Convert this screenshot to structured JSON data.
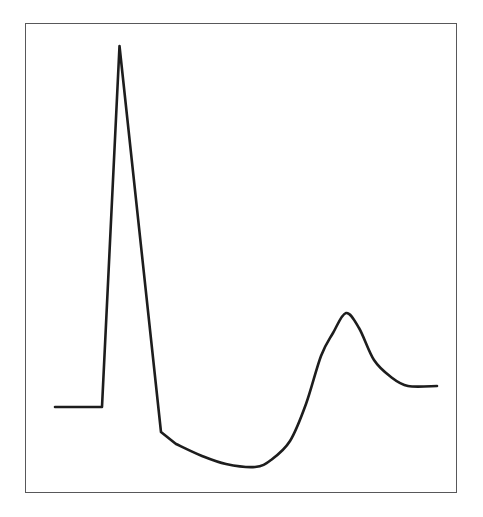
{
  "figure": {
    "background_color": "#ffffff",
    "width": 483,
    "height": 517
  },
  "plot_frame": {
    "border_color": "#58585a",
    "border_width_px": 1,
    "left": 25,
    "top": 23,
    "right": 457,
    "bottom": 493
  },
  "chart_data": {
    "type": "line",
    "title": "",
    "subtitle": "",
    "xlabel": "",
    "ylabel": "",
    "legend": [],
    "legend_position": "none",
    "grid": false,
    "axis_ticks": false,
    "axis_tick_labels": [],
    "annotations": [],
    "line_color": "#1d1d1d",
    "line_width_px": 2.6,
    "xlim": [
      0,
      100
    ],
    "ylim": [
      0,
      100
    ],
    "series": [
      {
        "name": "waveform",
        "x": [
          7.0,
          17.9,
          21.8,
          31.5,
          35.0,
          41.0,
          46.5,
          53.3,
          57.0,
          61.5,
          65.2,
          68.8,
          71.5,
          74.5,
          77.5,
          81.0,
          85.0,
          89.0,
          95.5
        ],
        "y": [
          36.5,
          36.5,
          95.1,
          22.6,
          20.0,
          16.5,
          14.6,
          13.9,
          15.5,
          19.4,
          27.2,
          37.5,
          47.2,
          51.5,
          48.4,
          41.7,
          38.1,
          37.4,
          37.4
        ],
        "pixel_points": [
          {
            "label": "baseline-start",
            "x": 55,
            "y": 407
          },
          {
            "label": "baseline-end",
            "x": 102,
            "y": 407
          },
          {
            "label": "r-peak-apex",
            "x": 119.5,
            "y": 46
          },
          {
            "label": "s-notch",
            "x": 161,
            "y": 432
          },
          {
            "label": "decline-1",
            "x": 176,
            "y": 444
          },
          {
            "label": "decline-2",
            "x": 202,
            "y": 456
          },
          {
            "label": "decline-3",
            "x": 226,
            "y": 464
          },
          {
            "label": "trough-bottom",
            "x": 255,
            "y": 467
          },
          {
            "label": "rise-1",
            "x": 271,
            "y": 460
          },
          {
            "label": "rise-2",
            "x": 290,
            "y": 441
          },
          {
            "label": "rise-3",
            "x": 306,
            "y": 404
          },
          {
            "label": "rise-4",
            "x": 321,
            "y": 356
          },
          {
            "label": "t-peak-apex",
            "x": 333,
            "y": 333
          },
          {
            "label": "t-fall-1",
            "x": 346,
            "y": 313
          },
          {
            "label": "t-fall-2",
            "x": 359,
            "y": 328
          },
          {
            "label": "t-fall-3",
            "x": 374,
            "y": 360
          },
          {
            "label": "settle-1",
            "x": 391,
            "y": 377
          },
          {
            "label": "settle-2",
            "x": 408,
            "y": 386
          },
          {
            "label": "plateau-end",
            "x": 437,
            "y": 386
          }
        ]
      }
    ],
    "features": [
      {
        "name": "isoelectric-baseline-left",
        "value": "flat segment at y=407px"
      },
      {
        "name": "r-wave-peak",
        "value": "apex at (119.5, 46)px — tallest excursion"
      },
      {
        "name": "s-wave-notch",
        "value": "slope break at (161, 432)px — below baseline"
      },
      {
        "name": "trough-minimum",
        "value": "lowest point at (255, 467)px"
      },
      {
        "name": "t-wave-peak",
        "value": "rounded maximum at (333, 333)px"
      },
      {
        "name": "plateau-right",
        "value": "flat segment at y=386px"
      }
    ]
  }
}
